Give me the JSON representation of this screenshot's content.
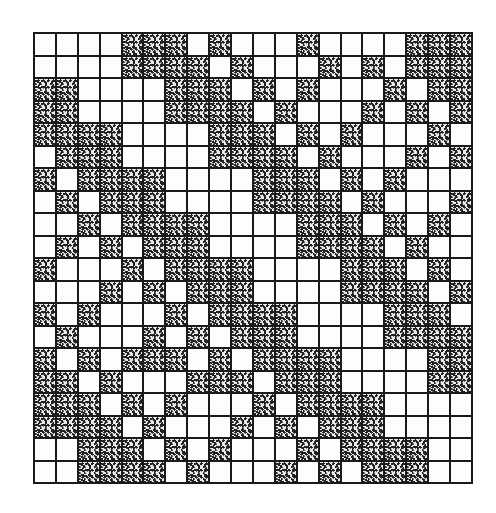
{
  "figure": {
    "type": "binary-grid",
    "rows": 20,
    "cols": 20,
    "legend": {
      "0": "white (empty)",
      "1": "stippled (dark)"
    },
    "structure": "2x2 block matrix [[A, B], [B, A]] with A and B each 10x10",
    "colors": {
      "line": "#1a1a1a",
      "empty": "#fdfdfd",
      "stipple": "#222222"
    },
    "grid": [
      "00001110100010000111",
      "00001111010001010111",
      "11000011101010001011",
      "11000011110100010101",
      "11110000111010100010",
      "01110000111101000101",
      "10111100001110101000",
      "01011100001111010001",
      "00101111000011101010",
      "01010111000011110100",
      "10001011110000111010",
      "00010101110000111101",
      "10100010111100001110",
      "01000101011100001111",
      "10101110101111000011",
      "11010001110111000011",
      "11101010001011110000",
      "11110100010101110000",
      "00111010100010111100",
      "00111101000101011100"
    ]
  }
}
